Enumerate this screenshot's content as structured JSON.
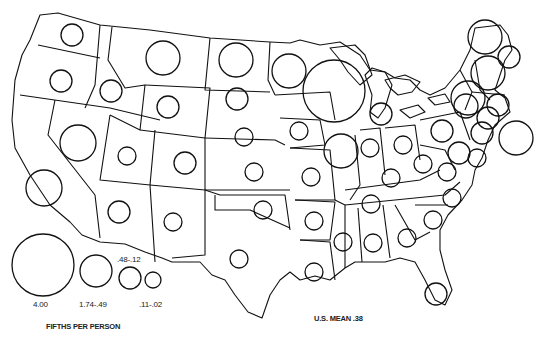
{
  "legend": {
    "title": "FIFTHS PER PERSON",
    "classes": [
      {
        "label": "4.00",
        "r": 31,
        "cx": 43,
        "cy": 265
      },
      {
        "label": "1.74-.49",
        "r": 16,
        "cx": 96,
        "cy": 271
      },
      {
        "label": ".48-.12",
        "r": 11,
        "cx": 130,
        "cy": 278
      },
      {
        "label": ".11-.02",
        "r": 8,
        "cx": 153,
        "cy": 280
      }
    ]
  },
  "mean_label": "U.S. MEAN .38",
  "colors": {
    "stroke": "#111111",
    "background": "#ffffff"
  },
  "chart_data": {
    "type": "proportional-symbol-map",
    "title": "FIFTHS PER PERSON",
    "region": "Contiguous United States",
    "legend_classes": [
      "4.00",
      "1.74-.49",
      ".48-.12",
      ".11-.02"
    ],
    "us_mean": 0.38,
    "symbols": [
      {
        "state": "WA",
        "cx": 72,
        "cy": 35,
        "r": 11,
        "class": ".48-.12"
      },
      {
        "state": "OR",
        "cx": 61,
        "cy": 81,
        "r": 11,
        "class": ".48-.12"
      },
      {
        "state": "ID",
        "cx": 111,
        "cy": 91,
        "r": 11,
        "class": ".48-.12"
      },
      {
        "state": "MT",
        "cx": 163,
        "cy": 58,
        "r": 17,
        "class": "1.74-.49"
      },
      {
        "state": "WY",
        "cx": 168,
        "cy": 107,
        "r": 11,
        "class": ".48-.12"
      },
      {
        "state": "ND",
        "cx": 236,
        "cy": 60,
        "r": 17,
        "class": "1.74-.49"
      },
      {
        "state": "SD",
        "cx": 237,
        "cy": 99,
        "r": 11,
        "class": ".48-.12"
      },
      {
        "state": "NE",
        "cx": 244,
        "cy": 137,
        "r": 9,
        "class": ".48-.12"
      },
      {
        "state": "MN",
        "cx": 289,
        "cy": 71,
        "r": 17,
        "class": "1.74-.49"
      },
      {
        "state": "WI",
        "cx": 334,
        "cy": 91,
        "r": 31,
        "class": "4.00"
      },
      {
        "state": "MI",
        "cx": 381,
        "cy": 114,
        "r": 11,
        "class": ".48-.12"
      },
      {
        "state": "CA",
        "cx": 44,
        "cy": 188,
        "r": 18,
        "class": "1.74-.49"
      },
      {
        "state": "NV",
        "cx": 78,
        "cy": 143,
        "r": 18,
        "class": "1.74-.49"
      },
      {
        "state": "UT",
        "cx": 127,
        "cy": 156,
        "r": 9,
        "class": ".48-.12"
      },
      {
        "state": "CO",
        "cx": 185,
        "cy": 163,
        "r": 11,
        "class": ".48-.12"
      },
      {
        "state": "AZ",
        "cx": 119,
        "cy": 212,
        "r": 11,
        "class": ".48-.12"
      },
      {
        "state": "NM",
        "cx": 173,
        "cy": 222,
        "r": 9,
        "class": ".48-.12"
      },
      {
        "state": "KS",
        "cx": 254,
        "cy": 172,
        "r": 9,
        "class": ".48-.12"
      },
      {
        "state": "OK",
        "cx": 263,
        "cy": 210,
        "r": 9,
        "class": ".48-.12"
      },
      {
        "state": "TX",
        "cx": 239,
        "cy": 259,
        "r": 9,
        "class": ".48-.12"
      },
      {
        "state": "IA",
        "cx": 299,
        "cy": 131,
        "r": 9,
        "class": ".48-.12"
      },
      {
        "state": "MO",
        "cx": 311,
        "cy": 177,
        "r": 9,
        "class": ".48-.12"
      },
      {
        "state": "AR",
        "cx": 314,
        "cy": 221,
        "r": 9,
        "class": ".48-.12"
      },
      {
        "state": "LA",
        "cx": 314,
        "cy": 272,
        "r": 9,
        "class": ".48-.12"
      },
      {
        "state": "IL",
        "cx": 341,
        "cy": 151,
        "r": 17,
        "class": "1.74-.49"
      },
      {
        "state": "IN",
        "cx": 370,
        "cy": 148,
        "r": 9,
        "class": ".48-.12"
      },
      {
        "state": "OH",
        "cx": 403,
        "cy": 145,
        "r": 9,
        "class": ".48-.12"
      },
      {
        "state": "KY",
        "cx": 391,
        "cy": 178,
        "r": 9,
        "class": ".48-.12"
      },
      {
        "state": "TN",
        "cx": 371,
        "cy": 204,
        "r": 9,
        "class": ".48-.12"
      },
      {
        "state": "MS",
        "cx": 343,
        "cy": 242,
        "r": 9,
        "class": ".48-.12"
      },
      {
        "state": "AL",
        "cx": 373,
        "cy": 243,
        "r": 9,
        "class": ".48-.12"
      },
      {
        "state": "GA",
        "cx": 407,
        "cy": 238,
        "r": 9,
        "class": ".48-.12"
      },
      {
        "state": "FL",
        "cx": 436,
        "cy": 294,
        "r": 11,
        "class": ".48-.12"
      },
      {
        "state": "SC",
        "cx": 433,
        "cy": 220,
        "r": 9,
        "class": ".48-.12"
      },
      {
        "state": "NC",
        "cx": 452,
        "cy": 198,
        "r": 9,
        "class": ".48-.12"
      },
      {
        "state": "VA",
        "cx": 447,
        "cy": 172,
        "r": 9,
        "class": ".48-.12"
      },
      {
        "state": "WV",
        "cx": 423,
        "cy": 164,
        "r": 9,
        "class": ".48-.12"
      },
      {
        "state": "PA",
        "cx": 442,
        "cy": 131,
        "r": 11,
        "class": ".48-.12"
      },
      {
        "state": "NY",
        "cx": 466,
        "cy": 106,
        "r": 12,
        "class": ".48-.12"
      },
      {
        "state": "MD",
        "cx": 459,
        "cy": 153,
        "r": 11,
        "class": ".48-.12"
      },
      {
        "state": "DE",
        "cx": 477,
        "cy": 158,
        "r": 9,
        "class": ".48-.12"
      },
      {
        "state": "NJ",
        "cx": 482,
        "cy": 133,
        "r": 11,
        "class": ".48-.12"
      },
      {
        "state": "CT",
        "cx": 488,
        "cy": 118,
        "r": 11,
        "class": ".48-.12"
      },
      {
        "state": "RI",
        "cx": 498,
        "cy": 105,
        "r": 11,
        "class": ".48-.12"
      },
      {
        "state": "MA",
        "cx": 488,
        "cy": 73,
        "r": 17,
        "class": "1.74-.49"
      },
      {
        "state": "VT",
        "cx": 468,
        "cy": 98,
        "r": 17,
        "class": "1.74-.49"
      },
      {
        "state": "NH",
        "cx": 509,
        "cy": 57,
        "r": 11,
        "class": ".48-.12"
      },
      {
        "state": "ME",
        "cx": 485,
        "cy": 37,
        "r": 17,
        "class": "1.74-.49"
      },
      {
        "state": "Atlantic",
        "cx": 516,
        "cy": 138,
        "r": 17,
        "class": "1.74-.49"
      }
    ]
  }
}
